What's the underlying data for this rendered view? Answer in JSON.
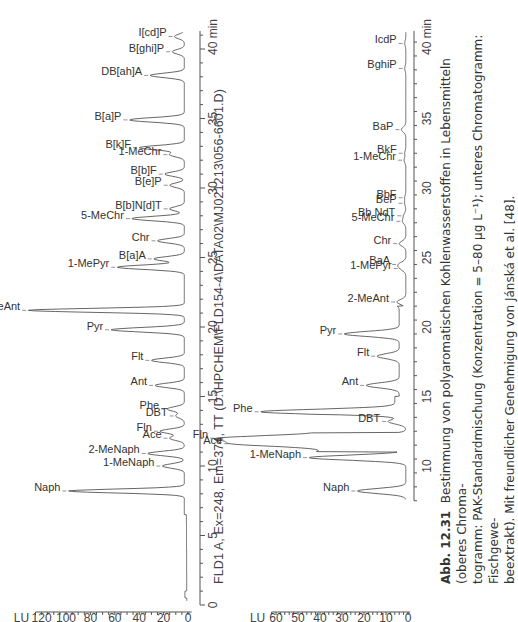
{
  "figure": {
    "number": "Abb. 12.31",
    "caption_lines": [
      "Bestimmung von polyaromatischen Kohlenwasserstoffen in Lebensmitteln (oberes Chroma-",
      "togramm: PAK-Standardmischung (Konzentration = 5–80 µg L⁻¹); unteres Chromatogramm: Fischgewe-",
      "beextrakt). Mit freundlicher Genehmigung von Jánská et al. [48]."
    ]
  },
  "chart_data": [
    {
      "type": "line",
      "title": "PAK-Standardmischung",
      "xlabel": "min",
      "ylabel": "LU",
      "xlim": [
        0,
        41
      ],
      "ylim": [
        -5,
        130
      ],
      "x_ticks": [
        0,
        5,
        10,
        15,
        20,
        25,
        30,
        35,
        40
      ],
      "y_ticks": [
        0,
        20,
        40,
        60,
        80,
        100,
        120
      ],
      "grid": false,
      "peaks": [
        {
          "label": "Naph",
          "rt": 8.2,
          "height": 95
        },
        {
          "label": "1-MeNaph",
          "rt": 10.0,
          "height": 18
        },
        {
          "label": "2-MeNaph",
          "rt": 10.9,
          "height": 30
        },
        {
          "label": "Ace",
          "rt": 12.0,
          "height": 12
        },
        {
          "label": "Fln",
          "rt": 12.5,
          "height": 20
        },
        {
          "label": "DBT",
          "rt": 13.6,
          "height": 7
        },
        {
          "label": "Phe",
          "rt": 14.1,
          "height": 14
        },
        {
          "label": "Ant",
          "rt": 15.8,
          "height": 24
        },
        {
          "label": "Flt",
          "rt": 17.6,
          "height": 27
        },
        {
          "label": "Pyr",
          "rt": 19.8,
          "height": 60
        },
        {
          "label": "2-MeAnt",
          "rt": 21.2,
          "height": 128
        },
        {
          "label": "1-MePyr",
          "rt": 24.3,
          "height": 55
        },
        {
          "label": "B[a]A",
          "rt": 24.9,
          "height": 25
        },
        {
          "label": "Chr",
          "rt": 26.2,
          "height": 22
        },
        {
          "label": "5-MeChr",
          "rt": 27.8,
          "height": 43
        },
        {
          "label": "B[b]N[d]T",
          "rt": 28.5,
          "height": 12
        },
        {
          "label": "B[e]P",
          "rt": 30.2,
          "height": 12
        },
        {
          "label": "B[b]F",
          "rt": 31.0,
          "height": 16
        },
        {
          "label": "1-MeChr",
          "rt": 32.4,
          "height": 12
        },
        {
          "label": "B[k]F",
          "rt": 32.9,
          "height": 37
        },
        {
          "label": "B[a]P",
          "rt": 34.9,
          "height": 45
        },
        {
          "label": "DB[ah]A",
          "rt": 38.1,
          "height": 28
        },
        {
          "label": "B[ghi]P",
          "rt": 39.8,
          "height": 10
        },
        {
          "label": "I[cd]P",
          "rt": 40.9,
          "height": 8
        }
      ]
    },
    {
      "type": "line",
      "title": "FLD1 A, Ex=248, Em=374, TT (D:\\HPCHEM\\FLD154-4\\DATA02\\MJ021213\\056-6601.D)",
      "xlabel": "min",
      "ylabel": "LU",
      "xlim": [
        0,
        41
      ],
      "ylim": [
        -2,
        62
      ],
      "x_ticks": [
        10,
        15,
        20,
        25,
        30,
        35,
        40
      ],
      "y_ticks": [
        0,
        10,
        20,
        30,
        40,
        50,
        60
      ],
      "grid": false,
      "peaks": [
        {
          "label": "Naph",
          "rt": 8.2,
          "height": 22
        },
        {
          "label": "1-MeNaph",
          "rt": 10.6,
          "height": 44
        },
        {
          "label": "Ace",
          "rt": 11.6,
          "height": 38
        },
        {
          "label": "Fln",
          "rt": 12.0,
          "height": 45
        },
        {
          "label": "DBT",
          "rt": 13.2,
          "height": 8
        },
        {
          "label": "Phe",
          "rt": 13.9,
          "height": 61
        },
        {
          "label": "Ant",
          "rt": 15.8,
          "height": 15
        },
        {
          "label": "Flt",
          "rt": 17.9,
          "height": 10
        },
        {
          "label": "Pyr",
          "rt": 19.5,
          "height": 25
        },
        {
          "label": "2-MeAnt",
          "rt": 21.8,
          "height": 4
        },
        {
          "label": "1-MePyr",
          "rt": 24.2,
          "height": 2
        },
        {
          "label": "BaA",
          "rt": 24.5,
          "height": 3
        },
        {
          "label": "Chr",
          "rt": 26.0,
          "height": 3
        },
        {
          "label": "5-MeChr",
          "rt": 27.6,
          "height": 1.5
        },
        {
          "label": "Bb NdT",
          "rt": 28.0,
          "height": 1
        },
        {
          "label": "BeP",
          "rt": 28.9,
          "height": 0.5
        },
        {
          "label": "BbF",
          "rt": 29.3,
          "height": 0.5
        },
        {
          "label": "1-MeChr",
          "rt": 32.0,
          "height": 0.8
        },
        {
          "label": "BkF",
          "rt": 32.5,
          "height": 0.5
        },
        {
          "label": "BaP",
          "rt": 34.2,
          "height": 2
        },
        {
          "label": "BghiP",
          "rt": 38.6,
          "height": 0.5
        },
        {
          "label": "IcdP",
          "rt": 40.4,
          "height": 0.5
        }
      ]
    }
  ],
  "top_chart": {
    "y_unit": "LU",
    "x_unit": "min",
    "y_tick_labels": [
      "0",
      "20",
      "40",
      "60",
      "80",
      "100",
      "120"
    ],
    "x_tick_labels": [
      "0",
      "5",
      "10",
      "15",
      "20",
      "25",
      "30",
      "35",
      "40 min"
    ]
  },
  "bottom_chart": {
    "header": "FLD1 A, Ex=248, Em=374, TT (D:\\HPCHEM\\FLD154-4\\DATA02\\MJ021213\\056-6601.D)",
    "y_unit": "LU",
    "y_tick_labels": [
      "0",
      "10",
      "20",
      "30",
      "40",
      "50",
      "60"
    ],
    "x_tick_labels": [
      "10",
      "15",
      "20",
      "25",
      "30",
      "35",
      "40 min"
    ]
  }
}
